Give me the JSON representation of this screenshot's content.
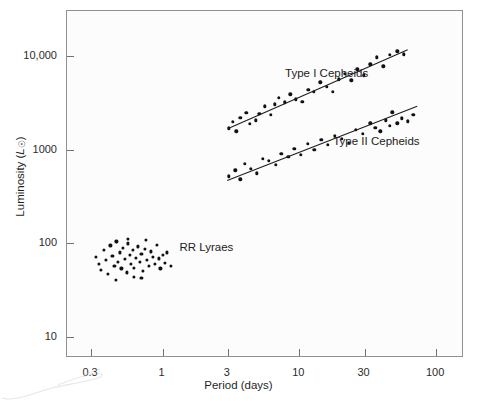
{
  "chart_data": {
    "type": "scatter",
    "title": "",
    "xlabel": "Period (days)",
    "ylabel": "Luminosity (L☉)",
    "xscale": "log",
    "yscale": "log",
    "xlim": [
      0.2,
      160
    ],
    "ylim": [
      6,
      30000
    ],
    "grid": false,
    "legend_position": "inline-annotations",
    "xticks": [
      {
        "value": 0.3,
        "label": "0.3"
      },
      {
        "value": 1,
        "label": "1"
      },
      {
        "value": 3,
        "label": "3"
      },
      {
        "value": 10,
        "label": "10"
      },
      {
        "value": 30,
        "label": "30"
      },
      {
        "value": 100,
        "label": "100"
      }
    ],
    "yticks": [
      {
        "value": 10000,
        "label": "10,000"
      },
      {
        "value": 1000,
        "label": "1000"
      },
      {
        "value": 100,
        "label": "100"
      },
      {
        "value": 10,
        "label": "10"
      }
    ],
    "series": [
      {
        "name": "Type I Cepheids",
        "label_x": 8.0,
        "label_y": 6200,
        "points": [
          [
            3.05,
            1680
          ],
          [
            3.25,
            1980
          ],
          [
            3.45,
            1560
          ],
          [
            3.7,
            2180
          ],
          [
            4.1,
            2450
          ],
          [
            4.35,
            1890
          ],
          [
            4.8,
            2050
          ],
          [
            5.1,
            2420
          ],
          [
            5.6,
            2900
          ],
          [
            6.2,
            2350
          ],
          [
            6.6,
            3050
          ],
          [
            7.1,
            3550
          ],
          [
            7.8,
            3180
          ],
          [
            8.6,
            3900
          ],
          [
            9.4,
            3450
          ],
          [
            10.5,
            3250
          ],
          [
            11.6,
            4350
          ],
          [
            12.8,
            4150
          ],
          [
            14.2,
            5200
          ],
          [
            15.8,
            4700
          ],
          [
            17.5,
            4100
          ],
          [
            19.5,
            5600
          ],
          [
            21.5,
            6400
          ],
          [
            24.0,
            5500
          ],
          [
            26.5,
            7200
          ],
          [
            29.5,
            6200
          ],
          [
            33.0,
            8100
          ],
          [
            37.0,
            9600
          ],
          [
            41.0,
            7700
          ],
          [
            46.0,
            10200
          ],
          [
            52.0,
            11200
          ],
          [
            58.0,
            10400
          ]
        ],
        "fit_line": {
          "x1": 3.0,
          "y1": 1700,
          "x2": 62.0,
          "y2": 11800
        }
      },
      {
        "name": "Type II Cepheids",
        "label_x": 18.0,
        "label_y": 1180,
        "points": [
          [
            3.05,
            520
          ],
          [
            3.4,
            600
          ],
          [
            3.7,
            480
          ],
          [
            4.0,
            700
          ],
          [
            4.4,
            620
          ],
          [
            4.9,
            560
          ],
          [
            5.4,
            800
          ],
          [
            6.0,
            760
          ],
          [
            6.7,
            690
          ],
          [
            7.4,
            900
          ],
          [
            8.3,
            840
          ],
          [
            9.2,
            1020
          ],
          [
            10.3,
            880
          ],
          [
            11.5,
            1150
          ],
          [
            12.9,
            1000
          ],
          [
            14.5,
            1280
          ],
          [
            16.2,
            1120
          ],
          [
            18.2,
            1400
          ],
          [
            20.5,
            1300
          ],
          [
            23.0,
            1180
          ],
          [
            26.0,
            1620
          ],
          [
            29.0,
            1480
          ],
          [
            33.0,
            1900
          ],
          [
            36.0,
            1700
          ],
          [
            39.0,
            1560
          ],
          [
            43.0,
            2050
          ],
          [
            46.0,
            1780
          ],
          [
            48.0,
            2500
          ],
          [
            52.0,
            1900
          ],
          [
            56.0,
            2150
          ],
          [
            62.0,
            2000
          ],
          [
            68.0,
            2350
          ]
        ],
        "fit_line": {
          "x1": 2.95,
          "y1": 470,
          "x2": 72.0,
          "y2": 2900
        }
      },
      {
        "name": "RR Lyraes",
        "label_x": 1.35,
        "label_y": 88,
        "points": [
          [
            0.325,
            72
          ],
          [
            0.34,
            60
          ],
          [
            0.355,
            52
          ],
          [
            0.37,
            85
          ],
          [
            0.385,
            66
          ],
          [
            0.4,
            47
          ],
          [
            0.415,
            95
          ],
          [
            0.43,
            74
          ],
          [
            0.445,
            58
          ],
          [
            0.46,
            105
          ],
          [
            0.47,
            63
          ],
          [
            0.485,
            80
          ],
          [
            0.5,
            54
          ],
          [
            0.515,
            90
          ],
          [
            0.53,
            68
          ],
          [
            0.545,
            49
          ],
          [
            0.56,
            100
          ],
          [
            0.575,
            76
          ],
          [
            0.59,
            61
          ],
          [
            0.605,
            86
          ],
          [
            0.62,
            55
          ],
          [
            0.64,
            70
          ],
          [
            0.66,
            93
          ],
          [
            0.68,
            64
          ],
          [
            0.7,
            78
          ],
          [
            0.72,
            51
          ],
          [
            0.745,
            88
          ],
          [
            0.77,
            67
          ],
          [
            0.795,
            57
          ],
          [
            0.82,
            82
          ],
          [
            0.845,
            72
          ],
          [
            0.875,
            60
          ],
          [
            0.905,
            97
          ],
          [
            0.935,
            69
          ],
          [
            0.965,
            54
          ],
          [
            1.0,
            75
          ],
          [
            1.04,
            62
          ],
          [
            1.08,
            80
          ],
          [
            0.62,
            44
          ],
          [
            0.455,
            41
          ],
          [
            0.7,
            43
          ],
          [
            1.15,
            58
          ],
          [
            0.56,
            112
          ],
          [
            0.76,
            108
          ]
        ],
        "fit_line": null
      }
    ]
  },
  "axes": {
    "x_title": "Period (days)",
    "y_title_prefix": "Luminosity (",
    "y_title_symbol": "L",
    "y_title_sub": "☉",
    "y_title_suffix": ")"
  },
  "annotations": [
    {
      "name": "type-i-cepheids-label",
      "text": "Type I Cepheids"
    },
    {
      "name": "type-ii-cepheids-label",
      "text": "Type II Cepheids"
    },
    {
      "name": "rr-lyraes-label",
      "text": "RR Lyraes"
    }
  ]
}
